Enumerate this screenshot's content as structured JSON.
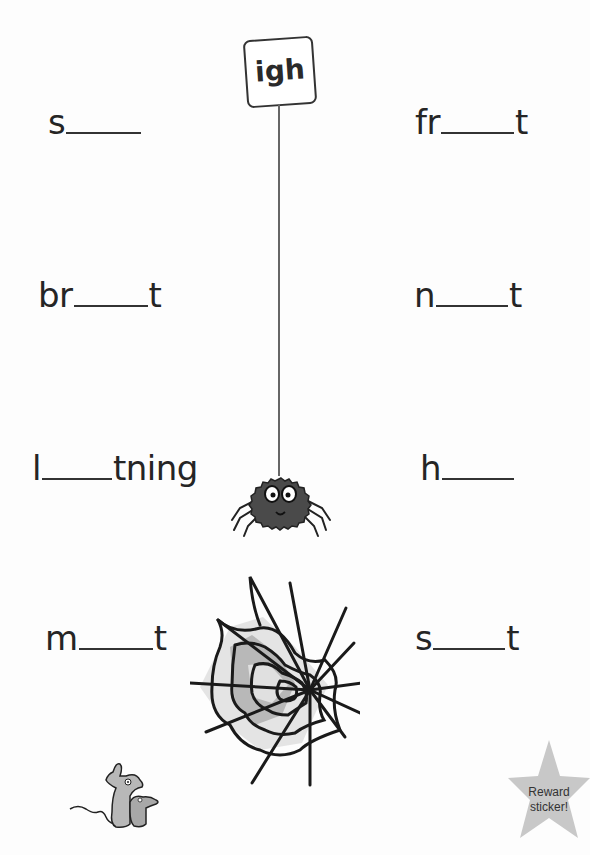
{
  "worksheet": {
    "phonics_sign": {
      "label": "igh"
    },
    "words": [
      {
        "prefix": "s",
        "suffix": "",
        "answer": "sigh"
      },
      {
        "prefix": "fr",
        "suffix": "t",
        "answer": "fright"
      },
      {
        "prefix": "br",
        "suffix": "t",
        "answer": "bright"
      },
      {
        "prefix": "n",
        "suffix": "t",
        "answer": "night"
      },
      {
        "prefix": "l",
        "suffix": "tning",
        "answer": "lightning"
      },
      {
        "prefix": "h",
        "suffix": "",
        "answer": "high"
      },
      {
        "prefix": "m",
        "suffix": "t",
        "answer": "might"
      },
      {
        "prefix": "s",
        "suffix": "t",
        "answer": "sight"
      }
    ],
    "reward": {
      "line1": "Reward",
      "line2": "sticker!"
    }
  },
  "colors": {
    "ink": "#252525",
    "spider_body": "#4a4a4a",
    "web_light": "#e2e2e2",
    "web_dark": "#b4b4b4",
    "mouse": "#b8b8b8",
    "star": "#c8c8c8"
  }
}
